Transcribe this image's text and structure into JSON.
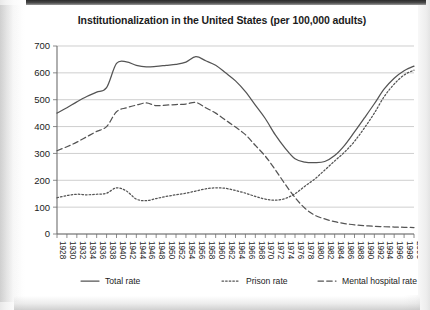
{
  "chart_data": {
    "type": "line",
    "title": "Institutionalization in the United States (per 100,000 adults)",
    "xlabel": "",
    "ylabel": "",
    "ylim": [
      0,
      700
    ],
    "ytick_step": 100,
    "yticks": [
      "0",
      "100",
      "200",
      "300",
      "400",
      "500",
      "600",
      "700"
    ],
    "grid": true,
    "legend_position": "bottom",
    "x": [
      1928,
      1930,
      1932,
      1934,
      1936,
      1938,
      1940,
      1942,
      1944,
      1946,
      1948,
      1950,
      1952,
      1954,
      1956,
      1958,
      1960,
      1962,
      1964,
      1966,
      1968,
      1970,
      1972,
      1974,
      1976,
      1978,
      1980,
      1982,
      1984,
      1986,
      1988,
      1990,
      1992,
      1994,
      1996,
      1998,
      2000
    ],
    "categories": [
      "1928",
      "1930",
      "1932",
      "1934",
      "1936",
      "1938",
      "1940",
      "1942",
      "1944",
      "1946",
      "1948",
      "1950",
      "1952",
      "1954",
      "1956",
      "1958",
      "1960",
      "1962",
      "1964",
      "1966",
      "1968",
      "1970",
      "1972",
      "1974",
      "1976",
      "1978",
      "1980",
      "1982",
      "1984",
      "1986",
      "1988",
      "1990",
      "1992",
      "1994",
      "1996",
      "1998",
      "2000"
    ],
    "series": [
      {
        "name": "Total rate",
        "style": "solid",
        "values": [
          450,
          470,
          492,
          512,
          528,
          545,
          635,
          641,
          628,
          622,
          624,
          628,
          632,
          640,
          660,
          645,
          628,
          600,
          570,
          530,
          480,
          430,
          370,
          320,
          280,
          268,
          266,
          270,
          292,
          330,
          380,
          432,
          485,
          540,
          580,
          608,
          625
        ]
      },
      {
        "name": "Prison rate",
        "style": "dotted",
        "values": [
          135,
          143,
          148,
          146,
          148,
          152,
          172,
          160,
          130,
          124,
          132,
          140,
          146,
          152,
          160,
          168,
          172,
          170,
          162,
          152,
          140,
          130,
          126,
          132,
          150,
          178,
          205,
          238,
          272,
          305,
          345,
          395,
          450,
          512,
          558,
          592,
          610
        ]
      },
      {
        "name": "Mental hospital rate",
        "style": "dashed",
        "values": [
          310,
          325,
          342,
          362,
          382,
          400,
          455,
          470,
          480,
          488,
          478,
          480,
          482,
          484,
          490,
          470,
          450,
          424,
          398,
          370,
          330,
          290,
          240,
          186,
          136,
          96,
          70,
          56,
          46,
          39,
          34,
          31,
          29,
          27,
          26,
          25,
          24
        ]
      }
    ]
  },
  "legend": {
    "items": [
      {
        "label": "Total rate",
        "style": "solid"
      },
      {
        "label": "Prison rate",
        "style": "dotted"
      },
      {
        "label": "Mental hospital rate",
        "style": "dashed"
      }
    ]
  }
}
